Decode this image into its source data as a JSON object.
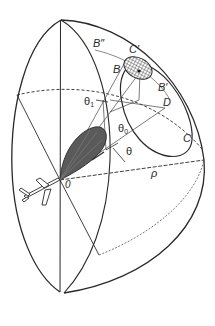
{
  "diagram": {
    "colors": {
      "line": "#2a2a2a",
      "thin_line": "#555555",
      "beam_fill": "#5a5a5a",
      "background": "#ffffff"
    },
    "labels": {
      "B_double_prime": "B″",
      "C_prime": "C′",
      "B": "B",
      "B_prime": "B′",
      "D": "D",
      "C": "C",
      "theta1": "θ",
      "theta1_sub": "1",
      "theta0": "θ",
      "theta0_sub": "0",
      "theta": "θ",
      "rho": "ρ",
      "origin": "0"
    },
    "elements": [
      "hemisphere-outline",
      "vertical-meridian",
      "dashed-equator",
      "footprint-ellipse-hatched",
      "large-ellipse-C",
      "antenna-main-lobe",
      "aircraft",
      "range-line-rho"
    ]
  }
}
